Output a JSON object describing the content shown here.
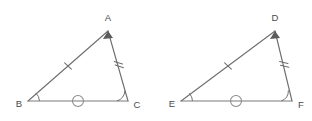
{
  "figure": {
    "background_color": "#ffffff",
    "stroke_color": "#6f6f6f",
    "label_color": "#4a4a4a",
    "mark_color": "#8a8a8a",
    "width": 312,
    "height": 121
  },
  "triangles": [
    {
      "id": "triangle-abc",
      "name": "Triangle ABC",
      "vertices": [
        {
          "label": "A",
          "role": "apex",
          "x": 108,
          "y": 31,
          "label_x": 108,
          "label_y": 18,
          "label_anchor": "middle"
        },
        {
          "label": "B",
          "role": "base-left",
          "x": 28,
          "y": 101,
          "label_x": 19,
          "label_y": 104,
          "label_anchor": "middle"
        },
        {
          "label": "C",
          "role": "base-right",
          "x": 128,
          "y": 101,
          "label_x": 137,
          "label_y": 105,
          "label_anchor": "middle"
        }
      ],
      "sides": [
        {
          "id": "side-ab",
          "from": "B",
          "to": "A",
          "tick_count": 1,
          "mark_type": "tick"
        },
        {
          "id": "side-ac",
          "from": "A",
          "to": "C",
          "tick_count": 2,
          "mark_type": "tick"
        },
        {
          "id": "side-bc",
          "from": "B",
          "to": "C",
          "tick_count": 0,
          "mark_type": "circle"
        }
      ],
      "angle_marks": [
        {
          "at": "B",
          "type": "arc",
          "count": 1
        },
        {
          "at": "C",
          "type": "arc",
          "count": 1
        }
      ]
    },
    {
      "id": "triangle-def",
      "name": "Triangle DEF",
      "vertices": [
        {
          "label": "D",
          "role": "apex",
          "x": 275,
          "y": 31,
          "label_x": 275,
          "label_y": 18,
          "label_anchor": "middle"
        },
        {
          "label": "E",
          "role": "base-left",
          "x": 181,
          "y": 101,
          "label_x": 172,
          "label_y": 104,
          "label_anchor": "middle"
        },
        {
          "label": "F",
          "role": "base-right",
          "x": 292,
          "y": 101,
          "label_x": 301,
          "label_y": 105,
          "label_anchor": "middle"
        }
      ],
      "sides": [
        {
          "id": "side-de",
          "from": "E",
          "to": "D",
          "tick_count": 1,
          "mark_type": "tick"
        },
        {
          "id": "side-df",
          "from": "D",
          "to": "F",
          "tick_count": 2,
          "mark_type": "tick"
        },
        {
          "id": "side-ef",
          "from": "E",
          "to": "F",
          "tick_count": 0,
          "mark_type": "circle"
        }
      ],
      "angle_marks": [
        {
          "at": "E",
          "type": "arc",
          "count": 1
        },
        {
          "at": "F",
          "type": "arc",
          "count": 1
        }
      ]
    }
  ],
  "markers": {
    "circle_radius": 5.5,
    "tick_length": 7,
    "double_tick_gap": 3
  }
}
